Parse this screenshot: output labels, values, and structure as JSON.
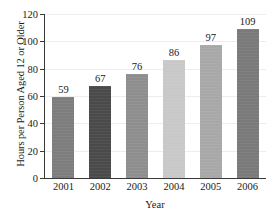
{
  "chart_data": {
    "type": "bar",
    "title": "",
    "xlabel": "Year",
    "ylabel": "Hours per Person Aged 12 or Older",
    "categories": [
      "2001",
      "2002",
      "2003",
      "2004",
      "2005",
      "2006"
    ],
    "values": [
      59,
      67,
      76,
      86,
      97,
      109
    ],
    "value_labels": [
      "59",
      "67",
      "76",
      "86",
      "97",
      "109"
    ],
    "ylim": [
      0,
      120
    ],
    "yticks": [
      0,
      20,
      40,
      60,
      80,
      100,
      120
    ],
    "ytick_labels": [
      "0",
      "20",
      "40",
      "60",
      "80",
      "100",
      "120"
    ],
    "grid": true,
    "grid_axis": "y",
    "legend": "none",
    "bar_colors": [
      "#7d7d7d",
      "#4a4a4a",
      "#8e8e8e",
      "#c8c8c8",
      "#a8a8a8",
      "#7a7a7a"
    ],
    "axis_color": "#3a3a3a",
    "gridline_color": "#ededed",
    "background_color": "#ffffff",
    "text_color": "#1a1a1a"
  }
}
